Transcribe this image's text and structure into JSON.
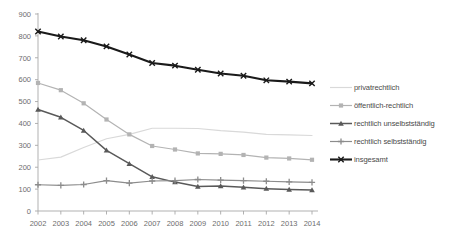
{
  "chart_data": {
    "type": "line",
    "title": "",
    "xlabel": "",
    "ylabel": "",
    "ylim": [
      0,
      900
    ],
    "ytick_step": 100,
    "yticks": [
      "0",
      "100",
      "200",
      "300",
      "400",
      "500",
      "600",
      "700",
      "800",
      "900"
    ],
    "grid": false,
    "legend_position": "right",
    "categories": [
      "2002",
      "2003",
      "2004",
      "2005",
      "2006",
      "2007",
      "2008",
      "2009",
      "2010",
      "2011",
      "2012",
      "2013",
      "2014"
    ],
    "series": [
      {
        "name": "privatrechtlich",
        "color": "#d9d9d9",
        "marker": "none",
        "values": [
          233,
          246,
          290,
          330,
          350,
          378,
          378,
          377,
          367,
          360,
          350,
          348,
          345
        ]
      },
      {
        "name": "öffentlich-rechtlich",
        "color": "#b3b3b3",
        "marker": "square",
        "values": [
          585,
          552,
          492,
          418,
          350,
          297,
          281,
          263,
          261,
          256,
          244,
          240,
          234
        ]
      },
      {
        "name": "rechtlich unselbstständig",
        "color": "#595959",
        "marker": "triangle",
        "values": [
          464,
          428,
          368,
          277,
          216,
          156,
          132,
          112,
          114,
          108,
          102,
          98,
          96
        ]
      },
      {
        "name": "rechtlich selbstständig",
        "color": "#8c8c8c",
        "marker": "plus",
        "values": [
          120,
          117,
          121,
          139,
          127,
          137,
          139,
          144,
          141,
          139,
          136,
          133,
          131
        ]
      },
      {
        "name": "insgesamt",
        "color": "#1a1a1a",
        "marker": "cross",
        "values": [
          820,
          797,
          780,
          752,
          715,
          676,
          664,
          645,
          628,
          618,
          597,
          591,
          583
        ]
      }
    ]
  },
  "legend": {
    "items": [
      {
        "label": "privatrechtlich"
      },
      {
        "label": "öffentlich-rechtlich"
      },
      {
        "label": "rechtlich unselbstständig"
      },
      {
        "label": "rechtlich selbstständig"
      },
      {
        "label": "insgesamt"
      }
    ]
  }
}
